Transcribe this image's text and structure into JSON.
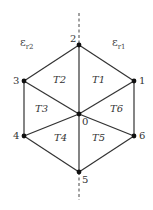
{
  "diagram": {
    "type": "hexagonal mesh with interface line",
    "nodes": [
      {
        "id": "0",
        "label": "0",
        "x": 79,
        "y": 114
      },
      {
        "id": "1",
        "label": "1",
        "x": 134,
        "y": 81
      },
      {
        "id": "2",
        "label": "2",
        "x": 79,
        "y": 45
      },
      {
        "id": "3",
        "label": "3",
        "x": 24,
        "y": 81
      },
      {
        "id": "4",
        "label": "4",
        "x": 24,
        "y": 136
      },
      {
        "id": "5",
        "label": "5",
        "x": 79,
        "y": 172
      },
      {
        "id": "6",
        "label": "6",
        "x": 134,
        "y": 136
      }
    ],
    "edges": [
      [
        "1",
        "2"
      ],
      [
        "2",
        "3"
      ],
      [
        "3",
        "4"
      ],
      [
        "4",
        "5"
      ],
      [
        "5",
        "6"
      ],
      [
        "6",
        "1"
      ],
      [
        "0",
        "1"
      ],
      [
        "0",
        "2"
      ],
      [
        "0",
        "3"
      ],
      [
        "0",
        "4"
      ],
      [
        "0",
        "5"
      ],
      [
        "0",
        "6"
      ]
    ],
    "triangles": [
      {
        "label": "T1",
        "nodes": [
          "0",
          "1",
          "2"
        ]
      },
      {
        "label": "T2",
        "nodes": [
          "0",
          "2",
          "3"
        ]
      },
      {
        "label": "T3",
        "nodes": [
          "0",
          "3",
          "4"
        ]
      },
      {
        "label": "T4",
        "nodes": [
          "0",
          "4",
          "5"
        ]
      },
      {
        "label": "T5",
        "nodes": [
          "0",
          "5",
          "6"
        ]
      },
      {
        "label": "T6",
        "nodes": [
          "0",
          "6",
          "1"
        ]
      }
    ],
    "regions": [
      {
        "label": "ε",
        "sub": "r2",
        "side": "left"
      },
      {
        "label": "ε",
        "sub": "r1",
        "side": "right"
      }
    ],
    "interface_line": {
      "style": "dashed",
      "orientation": "vertical",
      "x": 79
    }
  },
  "labels": {
    "n0": "0",
    "n1": "1",
    "n2": "2",
    "n3": "3",
    "n4": "4",
    "n5": "5",
    "n6": "6",
    "t1": "T1",
    "t2": "T2",
    "t3": "T3",
    "t4": "T4",
    "t5": "T5",
    "t6": "T6",
    "eps_left": "ε",
    "eps_left_sub": "r2",
    "eps_right": "ε",
    "eps_right_sub": "r1"
  }
}
